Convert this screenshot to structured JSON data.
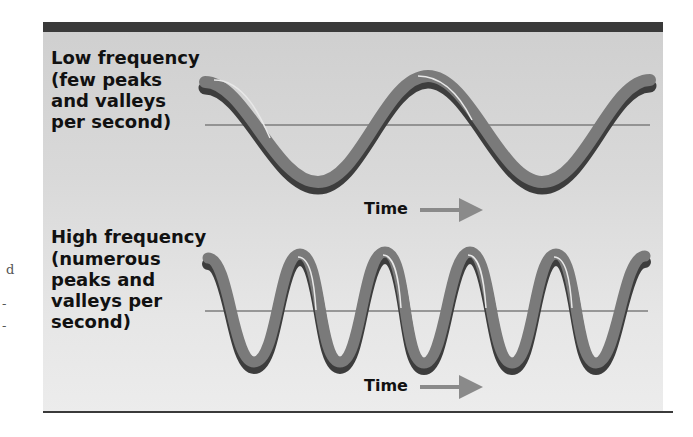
{
  "margin_marks": [
    "d",
    "-",
    "-"
  ],
  "low_frequency": {
    "title": "Low frequency",
    "description": "(few peaks\nand valleys\nper second)",
    "time_label": "Time",
    "cycles": 2
  },
  "high_frequency": {
    "title": "High frequency",
    "description": "(numerous\npeaks and\nvalleys per\nsecond)",
    "time_label": "Time",
    "cycles": 5
  },
  "colors": {
    "panel_bar": "#3a3a3a",
    "wave_main": "#7a7a7a",
    "wave_shadow": "#3d3d3d",
    "wave_highlight": "#e8e8e8",
    "baseline": "#7c7c7c",
    "arrow": "#8a8a8a"
  }
}
